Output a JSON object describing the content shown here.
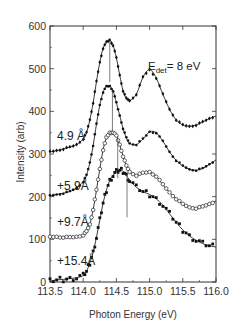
{
  "chart_data": {
    "type": "line",
    "title": "",
    "xlabel": "Photon Energy (eV)",
    "ylabel": "Intensity (arb)",
    "xlim": [
      113.5,
      116.0
    ],
    "ylim": [
      0,
      600
    ],
    "xticks": [
      "113.5",
      "114.0",
      "114.5",
      "115.0",
      "115.5",
      "116.0"
    ],
    "yticks": [
      "0",
      "100",
      "200",
      "300",
      "400",
      "500",
      "600"
    ],
    "grid": false,
    "legend": "none",
    "annotation": {
      "main": "E",
      "sub": "det",
      "rest": "= 8 eV"
    },
    "series": [
      {
        "name": "4.9 Å",
        "marker": "filled-diamond",
        "x": [
          113.5,
          113.6,
          113.7,
          113.8,
          113.9,
          114.0,
          114.05,
          114.1,
          114.15,
          114.2,
          114.25,
          114.3,
          114.35,
          114.4,
          114.45,
          114.5,
          114.55,
          114.6,
          114.65,
          114.7,
          114.8,
          114.9,
          115.0,
          115.1,
          115.2,
          115.3,
          115.4,
          115.5,
          115.6,
          115.7,
          115.8,
          115.9,
          116.0
        ],
        "values": [
          305,
          308,
          312,
          316,
          322,
          335,
          350,
          380,
          420,
          470,
          515,
          548,
          562,
          567,
          555,
          525,
          485,
          448,
          430,
          425,
          440,
          480,
          498,
          478,
          440,
          405,
          380,
          368,
          365,
          368,
          375,
          383,
          389
        ],
        "peak_marker_energy": 114.4
      },
      {
        "name": "+5.9Å",
        "marker": "filled-dot",
        "x": [
          113.5,
          113.6,
          113.7,
          113.8,
          113.9,
          114.0,
          114.05,
          114.1,
          114.15,
          114.2,
          114.25,
          114.3,
          114.35,
          114.4,
          114.45,
          114.5,
          114.55,
          114.6,
          114.65,
          114.7,
          114.8,
          114.9,
          115.0,
          115.1,
          115.2,
          115.3,
          115.4,
          115.5,
          115.6,
          115.7,
          115.8,
          115.9,
          116.0
        ],
        "values": [
          202,
          205,
          208,
          212,
          220,
          235,
          250,
          280,
          320,
          370,
          415,
          445,
          458,
          459,
          448,
          420,
          390,
          360,
          338,
          325,
          322,
          335,
          352,
          350,
          330,
          305,
          285,
          272,
          264,
          262,
          266,
          276,
          286
        ],
        "peak_marker_energy": 114.44
      },
      {
        "name": "+9.7Å",
        "marker": "open-circle",
        "x": [
          113.5,
          113.6,
          113.7,
          113.8,
          113.9,
          114.0,
          114.05,
          114.1,
          114.15,
          114.2,
          114.25,
          114.3,
          114.35,
          114.4,
          114.45,
          114.5,
          114.55,
          114.6,
          114.65,
          114.7,
          114.8,
          114.9,
          115.0,
          115.1,
          115.2,
          115.3,
          115.4,
          115.5,
          115.6,
          115.7,
          115.8,
          115.9,
          116.0
        ],
        "values": [
          105,
          106,
          105,
          104,
          106,
          110,
          118,
          135,
          170,
          215,
          265,
          310,
          338,
          350,
          351,
          342,
          322,
          295,
          272,
          258,
          250,
          255,
          258,
          248,
          228,
          210,
          195,
          182,
          175,
          173,
          176,
          183,
          190
        ],
        "peak_marker_energy": 114.52
      },
      {
        "name": "+15.4Å",
        "marker": "filled-square",
        "x": [
          113.5,
          113.6,
          113.7,
          113.8,
          113.9,
          114.0,
          114.05,
          114.1,
          114.15,
          114.2,
          114.25,
          114.3,
          114.35,
          114.4,
          114.45,
          114.5,
          114.55,
          114.6,
          114.65,
          114.7,
          114.8,
          114.9,
          115.0,
          115.1,
          115.2,
          115.3,
          115.4,
          115.5,
          115.6,
          115.7,
          115.8,
          115.9,
          116.0
        ],
        "values": [
          2,
          5,
          6,
          8,
          10,
          15,
          25,
          45,
          70,
          105,
          145,
          185,
          215,
          238,
          250,
          258,
          262,
          260,
          250,
          238,
          222,
          212,
          205,
          195,
          180,
          160,
          140,
          122,
          108,
          98,
          90,
          85,
          82
        ],
        "peak_marker_energy": 114.66
      }
    ]
  },
  "labels": {
    "xlabel": "Photon Energy (eV)",
    "ylabel": "Intensity (arb)",
    "annotation_main": "E",
    "annotation_sub": "det",
    "annotation_rest": "= 8 eV"
  }
}
